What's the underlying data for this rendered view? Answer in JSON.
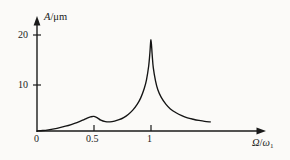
{
  "figure": {
    "name": "amplitude-frequency-response-curve",
    "background_color": "#fbfaf8",
    "line_color": "#141414"
  },
  "chart_data": {
    "type": "line",
    "title": "",
    "subtitle": "",
    "xlabel": "Ω/ω₁",
    "ylabel": "A/μm",
    "xlabel_parts": {
      "numerator": "Ω",
      "slash": "/",
      "denominator": "ω",
      "subscript": "1"
    },
    "ylabel_parts": {
      "quantity": "A",
      "slash": "/",
      "unit": "μm"
    },
    "xlim": [
      0,
      1.55
    ],
    "ylim": [
      0,
      23
    ],
    "grid": false,
    "legend": null,
    "x_ticks": [
      0,
      0.5,
      1
    ],
    "x_tick_labels": [
      "0",
      "0.5",
      "1"
    ],
    "y_ticks": [
      10,
      20
    ],
    "y_tick_labels": [
      "10",
      "20"
    ],
    "annotations": [
      {
        "label": "secondary resonance peak",
        "x": 0.5,
        "y": 3.0
      },
      {
        "label": "primary resonance peak",
        "x": 1.0,
        "y": 19.0
      }
    ],
    "series": [
      {
        "name": "amplitude",
        "x": [
          0.0,
          0.05,
          0.1,
          0.15,
          0.2,
          0.25,
          0.3,
          0.35,
          0.4,
          0.44,
          0.47,
          0.5,
          0.53,
          0.56,
          0.6,
          0.64,
          0.68,
          0.72,
          0.76,
          0.8,
          0.84,
          0.88,
          0.91,
          0.94,
          0.96,
          0.98,
          0.99,
          1.0,
          1.01,
          1.02,
          1.04,
          1.06,
          1.09,
          1.13,
          1.17,
          1.22,
          1.27,
          1.32,
          1.37,
          1.42,
          1.47,
          1.52
        ],
        "y": [
          0.0,
          0.1,
          0.25,
          0.45,
          0.7,
          1.0,
          1.35,
          1.75,
          2.25,
          2.7,
          2.95,
          3.05,
          2.75,
          2.25,
          1.95,
          1.9,
          2.05,
          2.35,
          2.8,
          3.45,
          4.35,
          5.6,
          6.9,
          8.8,
          10.6,
          13.6,
          16.2,
          19.0,
          16.0,
          13.2,
          10.4,
          8.6,
          7.0,
          5.6,
          4.6,
          3.8,
          3.2,
          2.75,
          2.45,
          2.2,
          2.0,
          1.9
        ]
      }
    ]
  }
}
